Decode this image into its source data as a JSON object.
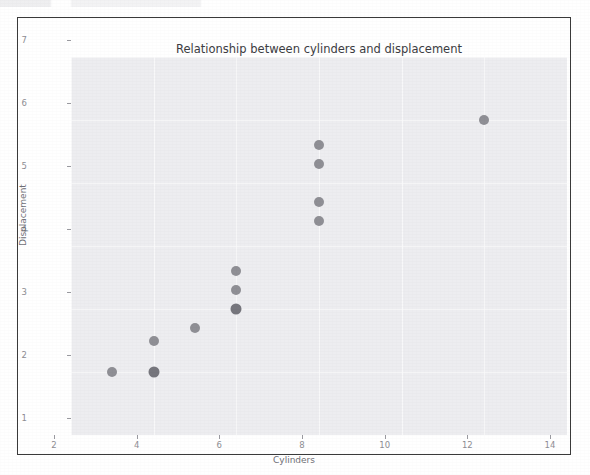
{
  "chart_data": {
    "type": "scatter",
    "title": "Relationship between cylinders and displacement",
    "xlabel": "Cylinders",
    "ylabel": "Displacement",
    "xlim": [
      2,
      14
    ],
    "ylim": [
      1,
      7
    ],
    "xticks": [
      "2",
      "4",
      "6",
      "8",
      "10",
      "12",
      "14"
    ],
    "xtick_values": [
      2,
      4,
      6,
      8,
      10,
      12,
      14
    ],
    "yticks": [
      "1",
      "2",
      "3",
      "4",
      "5",
      "6",
      "7"
    ],
    "ytick_values": [
      1,
      2,
      3,
      4,
      5,
      6,
      7
    ],
    "grid": true,
    "legend": null,
    "marker_color": "#8f8f95",
    "marker_overlap_color": "#76767d",
    "panel_color": "#ededf0",
    "points": [
      {
        "x": 3,
        "y": 2.0,
        "overlap": false
      },
      {
        "x": 4,
        "y": 2.5,
        "overlap": false
      },
      {
        "x": 4,
        "y": 2.0,
        "overlap": true
      },
      {
        "x": 5,
        "y": 2.7,
        "overlap": false
      },
      {
        "x": 6,
        "y": 3.6,
        "overlap": false
      },
      {
        "x": 6,
        "y": 3.3,
        "overlap": false
      },
      {
        "x": 6,
        "y": 3.0,
        "overlap": true
      },
      {
        "x": 8,
        "y": 5.6,
        "overlap": false
      },
      {
        "x": 8,
        "y": 5.3,
        "overlap": false
      },
      {
        "x": 8,
        "y": 4.7,
        "overlap": false
      },
      {
        "x": 8,
        "y": 4.4,
        "overlap": false
      },
      {
        "x": 12,
        "y": 6.0,
        "overlap": false
      }
    ]
  }
}
